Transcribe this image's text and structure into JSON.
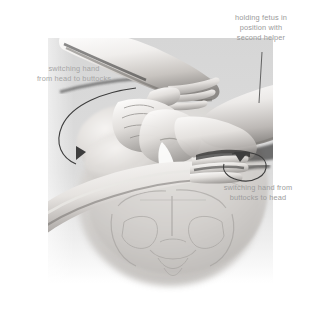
{
  "illustration": {
    "title": "External cephalic version — switching hands",
    "background_color": "#ffffff",
    "panel_color": "#d8d8d8",
    "skin_light": "#f2f0ee",
    "skin_mid": "#c9c6c3",
    "skin_shadow": "#8e8b88",
    "arrow_color": "#4a4a4a",
    "text_color": "#9a9a9a"
  },
  "annotations": [
    {
      "id": "helper",
      "name": "holding-fetus-label",
      "text": "holding fetus in\nposition with\nsecond helper",
      "leader": "vertical-line-down"
    },
    {
      "id": "head_to_buttocks",
      "name": "switching-hand-head-to-buttocks-label",
      "text": "switching hand\nfrom head to buttocks",
      "leader": "curved-arrow-down-left"
    },
    {
      "id": "buttocks_to_head",
      "name": "switching-hand-buttocks-to-head-label",
      "text": "switching hand from\nbuttocks to head",
      "leader": "curved-arrow-loop-right"
    }
  ],
  "figures": [
    {
      "name": "maternal-torso-abdomen"
    },
    {
      "name": "maternal-pelvis-skeleton"
    },
    {
      "name": "upper-left-forearm"
    },
    {
      "name": "lower-left-forearm"
    },
    {
      "name": "second-helper-forearm-right"
    },
    {
      "name": "grasping-hands-on-abdomen"
    }
  ]
}
